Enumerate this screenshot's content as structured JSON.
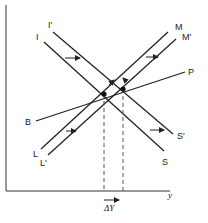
{
  "diagram": {
    "type": "IS-LM-BP diagram",
    "axes": {
      "x_label": "y",
      "y_label": ""
    },
    "curves": {
      "is_original": {
        "start_label": "I",
        "end_label": "S"
      },
      "is_shifted": {
        "start_label": "I'",
        "end_label": "S'"
      },
      "lm_original": {
        "start_label": "M",
        "end_label": "L"
      },
      "lm_shifted": {
        "start_label": "M'",
        "end_label": "L'"
      },
      "bp": {
        "start_label": "B",
        "end_label": "P"
      }
    },
    "annotation": {
      "delta_label": "ΔY"
    },
    "colors": {
      "line": "#222222",
      "dash": "#555555",
      "background": "#ffffff"
    }
  }
}
